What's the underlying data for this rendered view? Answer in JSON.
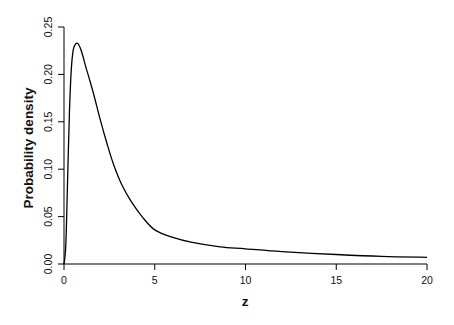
{
  "chart_data": {
    "type": "line",
    "title": "",
    "xlabel": "z",
    "ylabel": "Probability density",
    "xlim": [
      0,
      20
    ],
    "ylim": [
      0,
      0.25
    ],
    "grid": false,
    "legend": null,
    "x_ticks": [
      0,
      5,
      10,
      15,
      20
    ],
    "x_tick_labels": [
      "0",
      "5",
      "10",
      "15",
      "20"
    ],
    "y_ticks": [
      0,
      0.05,
      0.1,
      0.15,
      0.2,
      0.25
    ],
    "y_tick_labels": [
      "0.00",
      "0.05",
      "0.10",
      "0.15",
      "0.20",
      "0.25"
    ],
    "series": [
      {
        "name": "density",
        "color": "#000000",
        "x": [
          0.0,
          0.1,
          0.2,
          0.3,
          0.4,
          0.5,
          0.6,
          0.72,
          0.85,
          1.0,
          1.2,
          1.4,
          1.65,
          2.0,
          2.4,
          2.75,
          3.2,
          3.7,
          4.3,
          5.0,
          6.0,
          7.0,
          8.6,
          10.0,
          12.0,
          15.0,
          17.5,
          20.0
        ],
        "values": [
          0.0,
          0.02,
          0.09,
          0.16,
          0.205,
          0.225,
          0.231,
          0.233,
          0.23,
          0.222,
          0.208,
          0.195,
          0.178,
          0.152,
          0.125,
          0.104,
          0.083,
          0.066,
          0.05,
          0.036,
          0.028,
          0.023,
          0.018,
          0.016,
          0.013,
          0.01,
          0.008,
          0.007
        ]
      }
    ]
  },
  "labels": {
    "xlabel": "z",
    "ylabel": "Probability density"
  }
}
